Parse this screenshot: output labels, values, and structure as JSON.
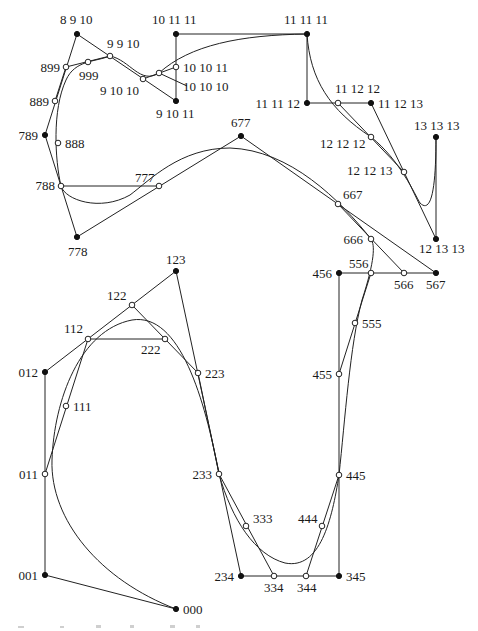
{
  "diagram": {
    "points": [
      {
        "id": "p_8_9_10",
        "label": "8 9 10",
        "x": 77,
        "y": 34,
        "type": "filled",
        "lx": 60,
        "ly": 24,
        "anchor": "start"
      },
      {
        "id": "p_10_11_11",
        "label": "10 11 11",
        "x": 176,
        "y": 34,
        "type": "filled",
        "lx": 152,
        "ly": 24,
        "anchor": "start"
      },
      {
        "id": "p_11_11_11",
        "label": "11 11 11",
        "x": 307,
        "y": 34,
        "type": "filled",
        "lx": 284,
        "ly": 24,
        "anchor": "start"
      },
      {
        "id": "p_9_9_10",
        "label": "9 9 10",
        "x": 110,
        "y": 56,
        "type": "open",
        "lx": 107,
        "ly": 48,
        "anchor": "start"
      },
      {
        "id": "p_899",
        "label": "899",
        "x": 66,
        "y": 67,
        "type": "open",
        "lx": 60,
        "ly": 72,
        "anchor": "end"
      },
      {
        "id": "p_999",
        "label": "999",
        "x": 88,
        "y": 62,
        "type": "open",
        "lx": 79,
        "ly": 80,
        "anchor": "start"
      },
      {
        "id": "p_10_10_11",
        "label": "10 10 11",
        "x": 176,
        "y": 67,
        "type": "open",
        "lx": 183,
        "ly": 72,
        "anchor": "start"
      },
      {
        "id": "p_10_10_10",
        "label": "10 10 10",
        "x": 159,
        "y": 73,
        "type": "open",
        "lx": 183,
        "ly": 91,
        "anchor": "start"
      },
      {
        "id": "p_9_10_10",
        "label": "9 10 10",
        "x": 143,
        "y": 79,
        "type": "open",
        "lx": 100,
        "ly": 95,
        "anchor": "start"
      },
      {
        "id": "p_9_10_11",
        "label": "9 10 11",
        "x": 176,
        "y": 101,
        "type": "filled",
        "lx": 156,
        "ly": 118,
        "anchor": "start"
      },
      {
        "id": "p_11_11_12",
        "label": "11 11 12",
        "x": 307,
        "y": 103,
        "type": "filled",
        "lx": 300,
        "ly": 108,
        "anchor": "end"
      },
      {
        "id": "p_11_12_12",
        "label": "11 12 12",
        "x": 338,
        "y": 103,
        "type": "open",
        "lx": 335,
        "ly": 93,
        "anchor": "start"
      },
      {
        "id": "p_11_12_13",
        "label": "11 12 13",
        "x": 371,
        "y": 103,
        "type": "filled",
        "lx": 378,
        "ly": 108,
        "anchor": "start"
      },
      {
        "id": "p_889",
        "label": "889",
        "x": 55,
        "y": 101,
        "type": "open",
        "lx": 49,
        "ly": 106,
        "anchor": "end"
      },
      {
        "id": "p_13_13_13",
        "label": "13 13 13",
        "x": 436,
        "y": 137,
        "type": "filled",
        "lx": 414,
        "ly": 130,
        "anchor": "start"
      },
      {
        "id": "p_12_12_12",
        "label": "12 12 12",
        "x": 371,
        "y": 137,
        "type": "open",
        "lx": 320,
        "ly": 148,
        "anchor": "start"
      },
      {
        "id": "p_677",
        "label": "677",
        "x": 241,
        "y": 136,
        "type": "filled",
        "lx": 231,
        "ly": 127,
        "anchor": "start"
      },
      {
        "id": "p_789",
        "label": "789",
        "x": 45,
        "y": 135,
        "type": "filled",
        "lx": 38,
        "ly": 140,
        "anchor": "end"
      },
      {
        "id": "p_888",
        "label": "888",
        "x": 58,
        "y": 143,
        "type": "open",
        "lx": 65,
        "ly": 148,
        "anchor": "start"
      },
      {
        "id": "p_12_12_13",
        "label": "12 12 13",
        "x": 404,
        "y": 172,
        "type": "open",
        "lx": 347,
        "ly": 175,
        "anchor": "start"
      },
      {
        "id": "p_777",
        "label": "777",
        "x": 159,
        "y": 186,
        "type": "open",
        "lx": 135,
        "ly": 182,
        "anchor": "start"
      },
      {
        "id": "p_788",
        "label": "788",
        "x": 61,
        "y": 186,
        "type": "open",
        "lx": 55,
        "ly": 190,
        "anchor": "end"
      },
      {
        "id": "p_667",
        "label": "667",
        "x": 338,
        "y": 204,
        "type": "open",
        "lx": 343,
        "ly": 199,
        "anchor": "start"
      },
      {
        "id": "p_778",
        "label": "778",
        "x": 77,
        "y": 237,
        "type": "filled",
        "lx": 68,
        "ly": 256,
        "anchor": "start"
      },
      {
        "id": "p_12_13_13",
        "label": "12 13 13",
        "x": 436,
        "y": 239,
        "type": "filled",
        "lx": 419,
        "ly": 253,
        "anchor": "start"
      },
      {
        "id": "p_666",
        "label": "666",
        "x": 371,
        "y": 239,
        "type": "open",
        "lx": 363,
        "ly": 244,
        "anchor": "end"
      },
      {
        "id": "p_123",
        "label": "123",
        "x": 176,
        "y": 271,
        "type": "filled",
        "lx": 166,
        "ly": 264,
        "anchor": "start"
      },
      {
        "id": "p_456",
        "label": "456",
        "x": 339,
        "y": 273,
        "type": "filled",
        "lx": 332,
        "ly": 278,
        "anchor": "end"
      },
      {
        "id": "p_556",
        "label": "556",
        "x": 371,
        "y": 273,
        "type": "open",
        "lx": 349,
        "ly": 268,
        "anchor": "start"
      },
      {
        "id": "p_566",
        "label": "566",
        "x": 404,
        "y": 273,
        "type": "open",
        "lx": 394,
        "ly": 289,
        "anchor": "start"
      },
      {
        "id": "p_567",
        "label": "567",
        "x": 436,
        "y": 273,
        "type": "filled",
        "lx": 426,
        "ly": 289,
        "anchor": "start"
      },
      {
        "id": "p_122",
        "label": "122",
        "x": 132,
        "y": 305,
        "type": "open",
        "lx": 107,
        "ly": 300,
        "anchor": "start"
      },
      {
        "id": "p_555",
        "label": "555",
        "x": 355,
        "y": 323,
        "type": "open",
        "lx": 362,
        "ly": 328,
        "anchor": "start"
      },
      {
        "id": "p_112",
        "label": "112",
        "x": 88,
        "y": 339,
        "type": "open",
        "lx": 64,
        "ly": 333,
        "anchor": "start"
      },
      {
        "id": "p_222",
        "label": "222",
        "x": 165,
        "y": 339,
        "type": "open",
        "lx": 141,
        "ly": 354,
        "anchor": "start"
      },
      {
        "id": "p_012",
        "label": "012",
        "x": 45,
        "y": 372,
        "type": "filled",
        "lx": 38,
        "ly": 377,
        "anchor": "end"
      },
      {
        "id": "p_223",
        "label": "223",
        "x": 198,
        "y": 373,
        "type": "open",
        "lx": 205,
        "ly": 378,
        "anchor": "start"
      },
      {
        "id": "p_455",
        "label": "455",
        "x": 339,
        "y": 374,
        "type": "open",
        "lx": 332,
        "ly": 379,
        "anchor": "end"
      },
      {
        "id": "p_111",
        "label": "111",
        "x": 66,
        "y": 406,
        "type": "open",
        "lx": 73,
        "ly": 411,
        "anchor": "start"
      },
      {
        "id": "p_011",
        "label": "011",
        "x": 45,
        "y": 474,
        "type": "open",
        "lx": 38,
        "ly": 479,
        "anchor": "end"
      },
      {
        "id": "p_233",
        "label": "233",
        "x": 219,
        "y": 474,
        "type": "open",
        "lx": 212,
        "ly": 479,
        "anchor": "end"
      },
      {
        "id": "p_445",
        "label": "445",
        "x": 339,
        "y": 475,
        "type": "open",
        "lx": 346,
        "ly": 480,
        "anchor": "start"
      },
      {
        "id": "p_333",
        "label": "333",
        "x": 246,
        "y": 526,
        "type": "open",
        "lx": 253,
        "ly": 523,
        "anchor": "start"
      },
      {
        "id": "p_444",
        "label": "444",
        "x": 322,
        "y": 526,
        "type": "open",
        "lx": 298,
        "ly": 523,
        "anchor": "start"
      },
      {
        "id": "p_001",
        "label": "001",
        "x": 45,
        "y": 575,
        "type": "filled",
        "lx": 38,
        "ly": 580,
        "anchor": "end"
      },
      {
        "id": "p_234",
        "label": "234",
        "x": 241,
        "y": 576,
        "type": "filled",
        "lx": 234,
        "ly": 581,
        "anchor": "end"
      },
      {
        "id": "p_334",
        "label": "334",
        "x": 274,
        "y": 576,
        "type": "open",
        "lx": 264,
        "ly": 592,
        "anchor": "start"
      },
      {
        "id": "p_344",
        "label": "344",
        "x": 306,
        "y": 576,
        "type": "open",
        "lx": 297,
        "ly": 592,
        "anchor": "start"
      },
      {
        "id": "p_345",
        "label": "345",
        "x": 339,
        "y": 576,
        "type": "filled",
        "lx": 346,
        "ly": 581,
        "anchor": "start"
      },
      {
        "id": "p_000",
        "label": "000",
        "x": 176,
        "y": 609,
        "type": "filled",
        "lx": 183,
        "ly": 614,
        "anchor": "start"
      }
    ],
    "polylines": [
      {
        "id": "control-polygon",
        "points": "176,609 45,575 45,372 176,271 241,576 339,576 339,273 436,273 241,136 77,237 45,135 77,34 176,101 176,34 307,34 307,103 371,103 436,239 436,137"
      },
      {
        "id": "subdiv-1",
        "points": "45,474 88,339 165,339"
      },
      {
        "id": "subdiv-2",
        "points": "132,305 198,373 219,474 274,576"
      },
      {
        "id": "subdiv-3",
        "points": "306,576 339,475"
      },
      {
        "id": "subdiv-4",
        "points": "339,374 371,273"
      },
      {
        "id": "subdiv-5",
        "points": "404,273 338,204"
      },
      {
        "id": "subdiv-6",
        "points": "159,186 61,186"
      },
      {
        "id": "subdiv-7",
        "points": "55,101 66,67 110,56"
      },
      {
        "id": "subdiv-8",
        "points": "143,79 176,67"
      },
      {
        "id": "subdiv-9",
        "points": "338,103 404,172"
      },
      {
        "id": "subdiv-10",
        "points": "159,73 187,86"
      }
    ],
    "curves": [
      {
        "id": "curve-1",
        "d": "M176,609 C100,580 50,520 52,460 C54,400 80,330 132,320 C180,312 205,400 219,474"
      },
      {
        "id": "curve-2",
        "d": "M219,474 C232,520 255,555 285,563 C320,570 332,520 339,475 C345,420 350,345 362,300 C375,260 375,245 371,239"
      },
      {
        "id": "curve-3",
        "d": "M371,239 C340,200 290,150 230,148 C180,148 150,180 130,195 C100,212 65,200 61,186 C55,160 52,110 66,80"
      },
      {
        "id": "curve-4",
        "d": "M66,80 C75,60 95,62 110,56 C130,60 140,85 159,73 C190,45 240,35 307,34"
      },
      {
        "id": "curve-5",
        "d": "M307,34 C310,80 330,110 371,137 C400,160 415,195 420,203 C432,215 436,185 436,137"
      }
    ],
    "caption": {
      "visible": "partially cut off at bottom edge"
    }
  }
}
